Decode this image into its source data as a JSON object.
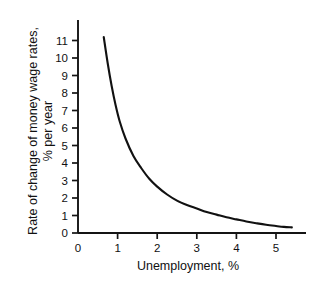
{
  "chart_data": {
    "type": "line",
    "title": "",
    "subtitle": "",
    "xlabel": "Unemployment, %",
    "ylabel_line1": "Rate of change of money wage rates,",
    "ylabel_line2": "% per year",
    "xlim": [
      0,
      5.8
    ],
    "ylim": [
      0,
      11.6
    ],
    "xticks": [
      0,
      1,
      2,
      3,
      4,
      5
    ],
    "xticklabels": [
      "0",
      "1",
      "2",
      "3",
      "4",
      "5"
    ],
    "yticks": [
      0,
      1,
      2,
      3,
      4,
      5,
      6,
      7,
      8,
      9,
      10,
      11
    ],
    "yticklabels": [
      "0",
      "1",
      "2",
      "3",
      "4",
      "5",
      "6",
      "7",
      "8",
      "9",
      "10",
      "11"
    ],
    "grid": false,
    "legend": null,
    "legend_position": "none",
    "series": [
      {
        "name": "Phillips curve",
        "color": "#111111",
        "x": [
          0.65,
          0.75,
          0.85,
          0.95,
          1.05,
          1.2,
          1.4,
          1.6,
          1.8,
          2.0,
          2.25,
          2.5,
          2.75,
          3.0,
          3.25,
          3.5,
          3.75,
          4.0,
          4.25,
          4.5,
          4.75,
          5.0,
          5.2,
          5.4
        ],
        "y": [
          11.2,
          9.7,
          8.4,
          7.3,
          6.4,
          5.4,
          4.4,
          3.7,
          3.1,
          2.65,
          2.2,
          1.85,
          1.6,
          1.4,
          1.2,
          1.05,
          0.9,
          0.78,
          0.66,
          0.56,
          0.47,
          0.4,
          0.35,
          0.32
        ]
      }
    ],
    "annotations": []
  },
  "axis": {
    "x_title": "Unemployment, %",
    "y_title_line1": "Rate of change of money wage rates,",
    "y_title_line2": "% per year"
  },
  "colors": {
    "curve": "#111111",
    "axis": "#141414",
    "background": "#ffffff"
  }
}
